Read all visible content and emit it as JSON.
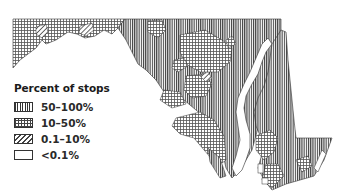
{
  "map": {
    "region": "Maryland",
    "legend": {
      "title": "Percent of stops",
      "items": [
        {
          "label": "50–100%",
          "pattern": "vertical-hatch"
        },
        {
          "label": "10–50%",
          "pattern": "crosshatch-grid"
        },
        {
          "label": "0.1–10%",
          "pattern": "diagonal-hatch"
        },
        {
          "label": "<0.1%",
          "pattern": "blank"
        }
      ]
    },
    "colors": {
      "ink": "#333333",
      "background": "#ffffff"
    }
  }
}
